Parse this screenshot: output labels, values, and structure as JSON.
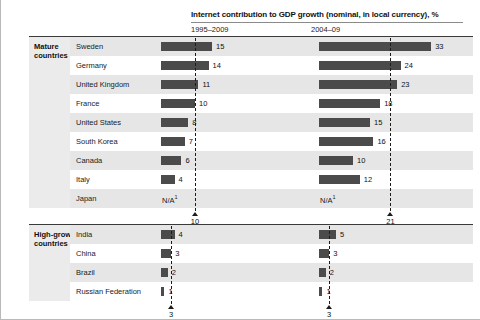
{
  "header": {
    "title": "Internet contribution to GDP growth (nominal, in local currency), %",
    "period_1": "1995–2009",
    "period_2": "2004–09"
  },
  "groups": {
    "mature": {
      "label_line_1": "Mature",
      "label_line_2": "countries"
    },
    "high_growth": {
      "label_line_1": "High-growth",
      "label_line_2": "countries"
    }
  },
  "labels": {
    "na": "N/A",
    "na_footnote": "1"
  },
  "chart_data": {
    "type": "bar",
    "title": "Internet contribution to GDP growth (nominal, in local currency), %",
    "xlabel": "",
    "ylabel": "",
    "grid": false,
    "legend": "none",
    "orientation": "horizontal",
    "panels": [
      {
        "name": "1995–2009",
        "xlim": [
          0,
          35
        ],
        "average": 10
      },
      {
        "name": "2004–09",
        "xlim": [
          0,
          35
        ],
        "average": 21
      }
    ],
    "groups": [
      {
        "name": "Mature countries",
        "categories": [
          "Sweden",
          "Germany",
          "United Kingdom",
          "France",
          "United States",
          "South Korea",
          "Canada",
          "Italy",
          "Japan"
        ],
        "series": [
          {
            "name": "1995–2009",
            "values": [
              15,
              14,
              11,
              10,
              8,
              7,
              6,
              4,
              null
            ],
            "average": 10
          },
          {
            "name": "2004–09",
            "values": [
              33,
              24,
              23,
              18,
              15,
              16,
              10,
              12,
              null
            ],
            "average": 21
          }
        ]
      },
      {
        "name": "High-growth countries",
        "categories": [
          "India",
          "China",
          "Brazil",
          "Russian Federation"
        ],
        "series": [
          {
            "name": "1995–2009",
            "values": [
              4,
              3,
              2,
              1
            ],
            "average": 3
          },
          {
            "name": "2004–09",
            "values": [
              5,
              3,
              2,
              1
            ],
            "average": 3
          }
        ]
      }
    ]
  },
  "colors": {
    "bar": "#4b4b4b",
    "band": "#e6e6e6",
    "panel": "#ebebeb",
    "rule": "#3a3a3a"
  }
}
